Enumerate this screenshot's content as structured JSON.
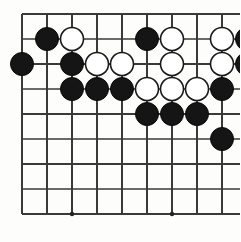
{
  "figure": {
    "title": "Go board position",
    "background_color": "#fdfdfc",
    "line_color": "#3a3a3a",
    "black_color": "#151515",
    "white_color": "#ffffff"
  },
  "board": {
    "columns": 10,
    "rows": 9,
    "origin_x": 22,
    "origin_y": 14,
    "spacing": 25,
    "stone_radius": 11.5,
    "star_point_radius": 2.2,
    "star_points": [
      {
        "col": 2,
        "row": 8
      },
      {
        "col": 6,
        "row": 8
      }
    ]
  },
  "stones": [
    {
      "col": 1,
      "row": 1,
      "color": "black"
    },
    {
      "col": 2,
      "row": 1,
      "color": "white"
    },
    {
      "col": 5,
      "row": 1,
      "color": "black"
    },
    {
      "col": 6,
      "row": 1,
      "color": "white"
    },
    {
      "col": 8,
      "row": 1,
      "color": "white"
    },
    {
      "col": 9,
      "row": 1,
      "color": "black"
    },
    {
      "col": 0,
      "row": 2,
      "color": "black"
    },
    {
      "col": 2,
      "row": 2,
      "color": "black"
    },
    {
      "col": 3,
      "row": 2,
      "color": "white"
    },
    {
      "col": 4,
      "row": 2,
      "color": "white"
    },
    {
      "col": 6,
      "row": 2,
      "color": "white"
    },
    {
      "col": 8,
      "row": 2,
      "color": "white"
    },
    {
      "col": 9,
      "row": 2,
      "color": "black"
    },
    {
      "col": 2,
      "row": 3,
      "color": "black"
    },
    {
      "col": 3,
      "row": 3,
      "color": "black"
    },
    {
      "col": 4,
      "row": 3,
      "color": "black"
    },
    {
      "col": 5,
      "row": 3,
      "color": "white"
    },
    {
      "col": 6,
      "row": 3,
      "color": "white"
    },
    {
      "col": 7,
      "row": 3,
      "color": "white"
    },
    {
      "col": 8,
      "row": 3,
      "color": "black"
    },
    {
      "col": 5,
      "row": 4,
      "color": "black"
    },
    {
      "col": 6,
      "row": 4,
      "color": "black"
    },
    {
      "col": 7,
      "row": 4,
      "color": "black"
    },
    {
      "col": 8,
      "row": 5,
      "color": "black"
    }
  ],
  "counts": {
    "black_stones": 15,
    "white_stones": 9,
    "total_stones": 24
  }
}
